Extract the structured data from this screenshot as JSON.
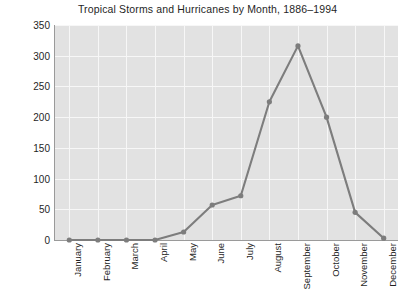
{
  "chart_data": {
    "type": "line",
    "title": "Tropical Storms and Hurricanes by Month, 1886–1994",
    "xlabel": "",
    "ylabel": "Number of Storms",
    "categories": [
      "January",
      "February",
      "March",
      "April",
      "May",
      "June",
      "July",
      "August",
      "September",
      "October",
      "November",
      "December"
    ],
    "values": [
      0,
      0,
      0,
      0,
      13,
      57,
      72,
      225,
      316,
      200,
      45,
      3
    ],
    "series": [
      {
        "name": "Number of Storms",
        "values": [
          0,
          0,
          0,
          0,
          13,
          57,
          72,
          225,
          316,
          200,
          45,
          3
        ]
      }
    ],
    "ylim": [
      0,
      350
    ],
    "yticks": [
      0,
      50,
      100,
      150,
      200,
      250,
      300,
      350
    ],
    "ytick_labels": [
      "0",
      "50",
      "100",
      "150",
      "200",
      "250",
      "300",
      "350"
    ],
    "grid": true,
    "legend": false,
    "markers": true,
    "colors": {
      "line": "#7d7d7d",
      "marker": "#7d7d7d",
      "plot_background": "#e2e2e2",
      "gridline": "#f7f7f7",
      "axis": "#9a9a9a",
      "text": "#1f1f1f",
      "figure_background": "#ffffff"
    }
  }
}
